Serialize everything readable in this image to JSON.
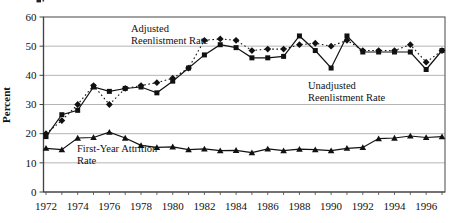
{
  "figure": {
    "background": "#ffffff",
    "has_cropped_text_fragment_top_left": true
  },
  "colors": {
    "series_line": "#111111",
    "marker_fill": "#111111",
    "grid": "#b5b5b5",
    "frame": "#666666",
    "axis": "#444444",
    "text": "#111111"
  },
  "chart_data": {
    "type": "line",
    "title": "",
    "xlabel": "",
    "ylabel": "Percent",
    "ylim": [
      0,
      60
    ],
    "y_ticks": [
      0,
      10,
      20,
      30,
      40,
      50,
      60
    ],
    "grid": "horizontal lines every 10, light gray, inside full box frame",
    "legend_position": "none (inline text annotations)",
    "x_tick_labels": [
      "1972",
      "1974",
      "1976",
      "1978",
      "1980",
      "1982",
      "1984",
      "1986",
      "1988",
      "1990",
      "1992",
      "1994",
      "1996"
    ],
    "x": [
      1972,
      1973,
      1974,
      1975,
      1976,
      1977,
      1978,
      1979,
      1980,
      1981,
      1982,
      1983,
      1984,
      1985,
      1986,
      1987,
      1988,
      1989,
      1990,
      1991,
      1992,
      1993,
      1994,
      1995,
      1996,
      1997
    ],
    "series": [
      {
        "name": "Adjusted Reenlistment Rate",
        "marker": "diamond",
        "line_style": "dotted",
        "values": [
          20,
          24.5,
          30,
          36.5,
          30,
          35.5,
          36.5,
          37.5,
          39,
          42.5,
          52,
          52.5,
          52,
          48.5,
          49,
          49,
          50.5,
          51,
          50,
          52,
          48.5,
          48.5,
          48.5,
          50.5,
          44.5,
          48.5
        ]
      },
      {
        "name": "Unadjusted Reenlistment Rate",
        "marker": "square",
        "line_style": "solid",
        "values": [
          19,
          26.5,
          28,
          36,
          34.5,
          35.5,
          36,
          34,
          38,
          42.5,
          47,
          50.5,
          49.5,
          46,
          46,
          46.5,
          53.5,
          48.5,
          42.5,
          53.5,
          48,
          48,
          48,
          48,
          42,
          48.5
        ]
      },
      {
        "name": "First-Year Attrition Rate",
        "marker": "triangle",
        "line_style": "solid",
        "values": [
          15,
          14.5,
          18.5,
          18.7,
          20.5,
          18.5,
          16,
          15.3,
          15.5,
          14.5,
          14.8,
          14.2,
          14.3,
          13.5,
          14.8,
          14.2,
          14.7,
          14.5,
          14.2,
          15,
          15.3,
          18.3,
          18.5,
          19.2,
          18.7,
          19
        ]
      }
    ],
    "annotations": [
      {
        "lines": [
          "Adjusted",
          "Reenlistment Rate"
        ],
        "x": 131,
        "y": 32
      },
      {
        "lines": [
          "Unadjusted",
          "Reenlistment Rate"
        ],
        "x": 308,
        "y": 89
      },
      {
        "lines": [
          "First-Year Attrition",
          "Rate"
        ],
        "x": 77,
        "y": 152
      }
    ]
  }
}
